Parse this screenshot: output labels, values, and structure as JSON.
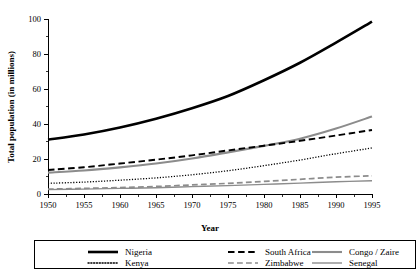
{
  "chart_data": {
    "type": "line",
    "title": "",
    "xlabel": "Year",
    "ylabel": "Total population (in millions)",
    "xlim": [
      1950,
      1995
    ],
    "ylim": [
      0,
      100
    ],
    "grid": false,
    "legend_position": "bottom",
    "x": [
      1950,
      1955,
      1960,
      1965,
      1970,
      1975,
      1980,
      1985,
      1990,
      1995
    ],
    "xticks": [
      "1950",
      "1955",
      "1960",
      "1965",
      "1970",
      "1975",
      "1980",
      "1985",
      "1990",
      "1995"
    ],
    "yticks": [
      "0",
      "20",
      "40",
      "60",
      "80",
      "100"
    ],
    "ytick_values": [
      0,
      20,
      40,
      60,
      80,
      100
    ],
    "y_minor_step": 10,
    "series": [
      {
        "name": "Nigeria",
        "color": "#000000",
        "style": "solid",
        "width": 2.6,
        "values": [
          31.0,
          34.0,
          38.0,
          43.0,
          49.0,
          56.0,
          65.0,
          75.0,
          86.5,
          98.5
        ]
      },
      {
        "name": "Kenya",
        "color": "#000000",
        "style": "dotted",
        "width": 1.3,
        "values": [
          6.1,
          6.8,
          7.9,
          9.2,
          11.0,
          13.3,
          16.2,
          19.4,
          23.0,
          26.3
        ]
      },
      {
        "name": "South Africa",
        "color": "#000000",
        "style": "dashed",
        "width": 1.9,
        "values": [
          13.7,
          15.3,
          17.4,
          19.6,
          22.1,
          24.9,
          27.6,
          30.4,
          33.4,
          36.6
        ]
      },
      {
        "name": "Zimbabwe",
        "color": "#8c8c8c",
        "style": "dashed",
        "width": 1.7,
        "values": [
          2.8,
          3.2,
          3.7,
          4.3,
          5.2,
          6.1,
          7.2,
          8.4,
          9.6,
          10.4
        ]
      },
      {
        "name": "Congo / Zaire",
        "color": "#8c8c8c",
        "style": "solid",
        "width": 2.1,
        "values": [
          12.2,
          13.4,
          15.2,
          17.4,
          20.3,
          23.8,
          27.5,
          31.6,
          37.4,
          44.3
        ]
      },
      {
        "name": "Senegal",
        "color": "#8c8c8c",
        "style": "solid",
        "width": 1.4,
        "values": [
          2.5,
          2.8,
          3.2,
          3.6,
          4.2,
          4.8,
          5.5,
          6.2,
          7.0,
          7.6
        ]
      }
    ]
  },
  "axes": {
    "y_title": "Total population (in millions)",
    "x_title": "Year"
  },
  "legend": {
    "entries": [
      {
        "label": "Nigeria",
        "series": "Nigeria"
      },
      {
        "label": "South Africa",
        "series": "South Africa"
      },
      {
        "label": "Congo / Zaire",
        "series": "Congo / Zaire"
      },
      {
        "label": "Kenya",
        "series": "Kenya"
      },
      {
        "label": "Zimbabwe",
        "series": "Zimbabwe"
      },
      {
        "label": "Senegal",
        "series": "Senegal"
      }
    ]
  }
}
